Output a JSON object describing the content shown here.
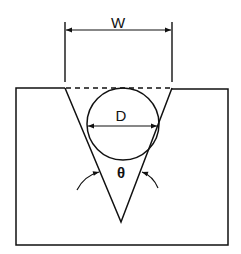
{
  "figure": {
    "labels": {
      "width": "W",
      "diameter": "D",
      "angle": "θ"
    },
    "colors": {
      "line": "#111111",
      "background": "#ffffff"
    }
  }
}
